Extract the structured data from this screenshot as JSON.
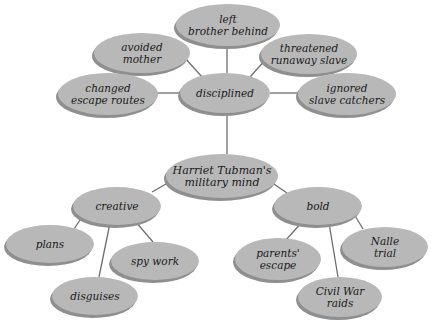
{
  "diagram": {
    "colors": {
      "bubble": "#b8b8b8",
      "bubble_shadow": "#8f8f8f",
      "edge": "#6e6e6e",
      "text": "#1a1a1a",
      "background": "#ffffff"
    },
    "nodes": [
      {
        "id": "center",
        "lines": [
          "Harriet Tubman's",
          "military mind"
        ],
        "cx": 222,
        "cy": 176,
        "rx": 56,
        "ry": 22
      },
      {
        "id": "disciplined",
        "lines": [
          "disciplined"
        ],
        "cx": 225,
        "cy": 93,
        "rx": 45,
        "ry": 20
      },
      {
        "id": "left-brother-behind",
        "lines": [
          "left",
          "brother behind"
        ],
        "cx": 228,
        "cy": 25,
        "rx": 52,
        "ry": 21
      },
      {
        "id": "avoided-mother",
        "lines": [
          "avoided",
          "mother"
        ],
        "cx": 142,
        "cy": 53,
        "rx": 48,
        "ry": 20
      },
      {
        "id": "changed-escape-routes",
        "lines": [
          "changed",
          "escape routes"
        ],
        "cx": 108,
        "cy": 94,
        "rx": 50,
        "ry": 21
      },
      {
        "id": "threatened-runaway-slave",
        "lines": [
          "threatened",
          "runaway slave"
        ],
        "cx": 309,
        "cy": 54,
        "rx": 48,
        "ry": 20
      },
      {
        "id": "ignored-slave-catchers",
        "lines": [
          "ignored",
          "slave catchers"
        ],
        "cx": 347,
        "cy": 94,
        "rx": 49,
        "ry": 21
      },
      {
        "id": "creative",
        "lines": [
          "creative"
        ],
        "cx": 117,
        "cy": 206,
        "rx": 44,
        "ry": 19
      },
      {
        "id": "plans",
        "lines": [
          "plans"
        ],
        "cx": 50,
        "cy": 244,
        "rx": 44,
        "ry": 19
      },
      {
        "id": "spy-work",
        "lines": [
          "spy work"
        ],
        "cx": 155,
        "cy": 261,
        "rx": 44,
        "ry": 19
      },
      {
        "id": "disguises",
        "lines": [
          "disguises"
        ],
        "cx": 95,
        "cy": 296,
        "rx": 43,
        "ry": 19
      },
      {
        "id": "bold",
        "lines": [
          "bold"
        ],
        "cx": 318,
        "cy": 206,
        "rx": 44,
        "ry": 19
      },
      {
        "id": "parents-escape",
        "lines": [
          "parents'",
          "escape"
        ],
        "cx": 278,
        "cy": 259,
        "rx": 43,
        "ry": 21
      },
      {
        "id": "nalle-trial",
        "lines": [
          "Nalle",
          "trial"
        ],
        "cx": 385,
        "cy": 247,
        "rx": 43,
        "ry": 20
      },
      {
        "id": "civil-war-raids",
        "lines": [
          "Civil War",
          "raids"
        ],
        "cx": 340,
        "cy": 297,
        "rx": 42,
        "ry": 20
      }
    ],
    "edges": [
      {
        "from": "center",
        "to": "disciplined",
        "x1": 227,
        "y1": 154,
        "x2": 227,
        "y2": 113
      },
      {
        "from": "disciplined",
        "to": "left-brother-behind",
        "x1": 227,
        "y1": 73,
        "x2": 227,
        "y2": 46
      },
      {
        "from": "disciplined",
        "to": "avoided-mother",
        "x1": 203,
        "y1": 78,
        "x2": 185,
        "y2": 58
      },
      {
        "from": "disciplined",
        "to": "changed-escape-routes",
        "x1": 180,
        "y1": 93,
        "x2": 157,
        "y2": 93
      },
      {
        "from": "disciplined",
        "to": "threatened-runaway-slave",
        "x1": 250,
        "y1": 77,
        "x2": 267,
        "y2": 58
      },
      {
        "from": "disciplined",
        "to": "ignored-slave-catchers",
        "x1": 270,
        "y1": 93,
        "x2": 298,
        "y2": 93
      },
      {
        "from": "center",
        "to": "creative",
        "x1": 192,
        "y1": 169,
        "x2": 152,
        "y2": 192
      },
      {
        "from": "center",
        "to": "bold",
        "x1": 252,
        "y1": 169,
        "x2": 287,
        "y2": 193
      },
      {
        "from": "creative",
        "to": "plans",
        "x1": 84,
        "y1": 214,
        "x2": 74,
        "y2": 229
      },
      {
        "from": "creative",
        "to": "spy-work",
        "x1": 135,
        "y1": 221,
        "x2": 153,
        "y2": 242
      },
      {
        "from": "creative",
        "to": "disguises",
        "x1": 110,
        "y1": 223,
        "x2": 99,
        "y2": 277
      },
      {
        "from": "bold",
        "to": "parents-escape",
        "x1": 303,
        "y1": 221,
        "x2": 285,
        "y2": 241
      },
      {
        "from": "bold",
        "to": "nalle-trial",
        "x1": 354,
        "y1": 214,
        "x2": 363,
        "y2": 229
      },
      {
        "from": "bold",
        "to": "civil-war-raids",
        "x1": 329,
        "y1": 223,
        "x2": 338,
        "y2": 277
      }
    ]
  }
}
